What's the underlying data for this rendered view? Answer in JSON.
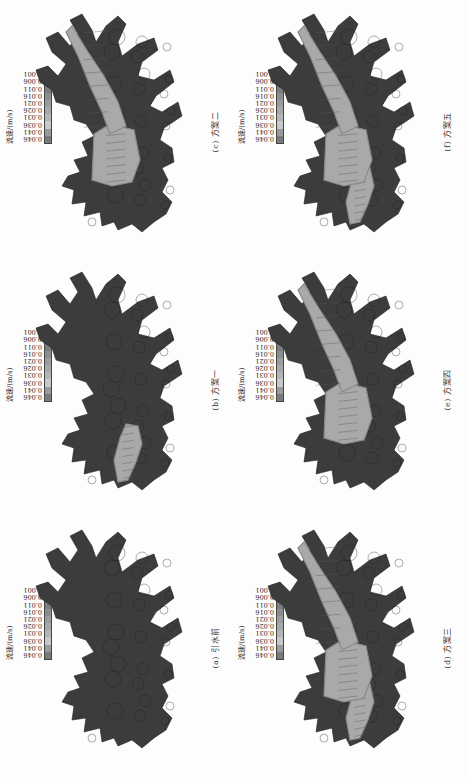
{
  "figure": {
    "orientation": "rotated-90-ccw",
    "legend": {
      "title": "流速/(m/s)",
      "values": [
        "0.046",
        "0.041",
        "0.036",
        "0.031",
        "0.026",
        "0.021",
        "0.016",
        "0.011",
        "0.006",
        "0.001"
      ],
      "colors": [
        "#7a7a7a",
        "#9a9a9a",
        "#c8c8c8",
        "#b4b4b4",
        "#a8a8a8",
        "#9c9c9c",
        "#8c8c8c",
        "#7c7c7c",
        "#606060",
        "#3a3a3a"
      ]
    },
    "map_colors": {
      "low_flow": "#3c3c3c",
      "high_flow": "#a9a9a9",
      "mid_flow": "#8a8a8a",
      "streamline": "#1a1a1a"
    },
    "panels": [
      {
        "id": "a",
        "caption": "(a) 引水前",
        "row": "top",
        "col": 0,
        "high_flow_zones": []
      },
      {
        "id": "b",
        "caption": "(b) 方案一",
        "row": "top",
        "col": 1,
        "high_flow_zones": [
          "inlet-left"
        ]
      },
      {
        "id": "c",
        "caption": "(c) 方案二",
        "row": "top",
        "col": 2,
        "high_flow_zones": [
          "center",
          "right-channel"
        ]
      },
      {
        "id": "d",
        "caption": "(d) 方案三",
        "row": "bottom",
        "col": 0,
        "high_flow_zones": [
          "inlet-left",
          "center",
          "right-channel"
        ]
      },
      {
        "id": "e",
        "caption": "(e) 方案四",
        "row": "bottom",
        "col": 1,
        "high_flow_zones": [
          "center",
          "right-channel"
        ]
      },
      {
        "id": "f",
        "caption": "(f) 方案五",
        "row": "bottom",
        "col": 2,
        "high_flow_zones": [
          "inlet-left",
          "center",
          "right-channel"
        ]
      }
    ]
  }
}
